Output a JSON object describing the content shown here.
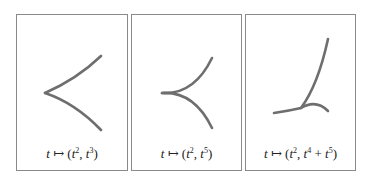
{
  "figure": {
    "panels": [
      {
        "caption": {
          "var": "t",
          "arrow": "↦",
          "x_base": "t",
          "x_exp": "2",
          "y_terms": [
            {
              "base": "t",
              "exp": "3"
            }
          ]
        },
        "label": "t ↦ (t², t³)",
        "curve_name": "cusp"
      },
      {
        "caption": {
          "var": "t",
          "arrow": "↦",
          "x_base": "t",
          "x_exp": "2",
          "y_terms": [
            {
              "base": "t",
              "exp": "5"
            }
          ]
        },
        "label": "t ↦ (t², t⁵)",
        "curve_name": "higher-order-cusp"
      },
      {
        "caption": {
          "var": "t",
          "arrow": "↦",
          "x_base": "t",
          "x_exp": "2",
          "y_terms": [
            {
              "base": "t",
              "exp": "4"
            },
            {
              "base": "t",
              "exp": "5"
            }
          ]
        },
        "label": "t ↦ (t², t⁴ + t⁵)",
        "curve_name": "ramphoid-cusp"
      }
    ],
    "colors": {
      "frame": "#8a8a8a",
      "curve": "#6e6e6e",
      "text": "#222222"
    }
  }
}
